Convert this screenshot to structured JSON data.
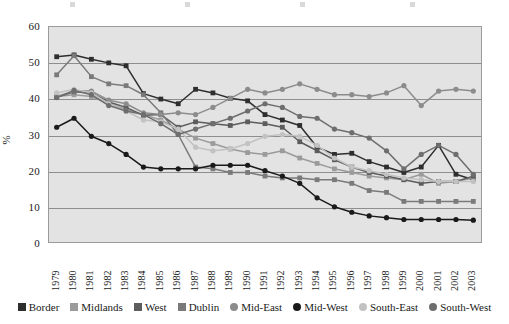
{
  "chart_data": {
    "type": "line",
    "title": "",
    "subtitle": "",
    "xlabel": "",
    "ylabel": "%",
    "ylim": [
      0,
      60
    ],
    "yticks": [
      0,
      10,
      20,
      30,
      40,
      50,
      60
    ],
    "grid": true,
    "legend_position": "bottom",
    "categories": [
      "1979",
      "1980",
      "1981",
      "1982",
      "1983",
      "1984",
      "1985",
      "1986",
      "1987",
      "1988",
      "1989",
      "1990",
      "1991",
      "1992",
      "1993",
      "1994",
      "1995",
      "1996",
      "1997",
      "1998",
      "1999",
      "2000",
      "2001",
      "2002",
      "2003"
    ],
    "series": [
      {
        "name": "Border",
        "marker": "square",
        "color": "#2e2e2e",
        "values": [
          51.5,
          52.0,
          50.8,
          49.8,
          49.0,
          41.3,
          39.8,
          38.5,
          42.5,
          41.5,
          40.0,
          39.3,
          35.5,
          34.0,
          32.5,
          26.5,
          24.5,
          24.8,
          22.5,
          21.0,
          19.5,
          21.0,
          27.0,
          19.0,
          17.5
        ]
      },
      {
        "name": "Midlands",
        "marker": "square",
        "color": "#9b9b9b",
        "values": [
          40.5,
          41.0,
          40.5,
          38.5,
          37.0,
          35.5,
          34.0,
          31.5,
          29.0,
          27.5,
          26.0,
          25.0,
          24.5,
          25.5,
          23.5,
          22.0,
          20.5,
          19.5,
          18.5,
          18.0,
          17.5,
          19.0,
          16.5,
          17.0,
          18.0
        ]
      },
      {
        "name": "West",
        "marker": "square",
        "color": "#5c5c5c",
        "values": [
          40.3,
          41.8,
          41.5,
          39.0,
          37.5,
          35.3,
          35.5,
          32.0,
          33.5,
          33.0,
          32.5,
          33.5,
          33.0,
          32.0,
          28.0,
          25.5,
          23.0,
          21.0,
          19.5,
          18.5,
          17.5,
          16.5,
          17.0,
          17.0,
          18.5
        ]
      },
      {
        "name": "Dublin",
        "marker": "square",
        "color": "#7a7a7a",
        "values": [
          46.5,
          51.8,
          46.0,
          44.0,
          43.5,
          41.0,
          36.0,
          30.0,
          21.0,
          20.5,
          19.5,
          19.5,
          18.5,
          18.0,
          18.0,
          17.5,
          17.5,
          16.5,
          14.5,
          14.0,
          11.5,
          11.5,
          11.5,
          11.5,
          11.5
        ]
      },
      {
        "name": "Mid-East",
        "marker": "circle",
        "color": "#8c8c8c",
        "values": [
          40.5,
          42.0,
          42.0,
          39.5,
          38.5,
          36.0,
          35.5,
          36.0,
          35.5,
          37.5,
          40.0,
          42.5,
          41.5,
          42.5,
          44.0,
          42.5,
          41.0,
          41.0,
          40.5,
          41.5,
          43.5,
          38.0,
          42.0,
          42.5,
          42.0
        ]
      },
      {
        "name": "Mid-West",
        "marker": "circle",
        "color": "#1a1a1a",
        "values": [
          32.0,
          34.5,
          29.5,
          27.5,
          24.5,
          21.0,
          20.5,
          20.5,
          20.5,
          21.5,
          21.5,
          21.5,
          20.0,
          18.5,
          16.5,
          12.5,
          10.0,
          8.5,
          7.5,
          7.0,
          6.5,
          6.5,
          6.5,
          6.5,
          6.3
        ]
      },
      {
        "name": "South-East",
        "marker": "circle",
        "color": "#c2c2c2",
        "values": [
          41.5,
          42.5,
          41.5,
          38.5,
          36.5,
          34.0,
          33.5,
          31.5,
          26.5,
          25.5,
          26.0,
          27.5,
          29.5,
          30.0,
          29.5,
          27.0,
          23.5,
          21.0,
          20.0,
          19.0,
          18.0,
          17.5,
          17.0,
          17.0,
          17.0
        ]
      },
      {
        "name": "South-West",
        "marker": "circle",
        "color": "#6e6e6e",
        "values": [
          40.2,
          42.2,
          41.0,
          38.0,
          36.5,
          35.5,
          33.0,
          30.0,
          31.5,
          33.0,
          34.5,
          36.5,
          38.5,
          37.5,
          35.0,
          34.5,
          31.5,
          30.5,
          29.0,
          25.5,
          20.5,
          24.5,
          27.0,
          24.5,
          19.0
        ]
      }
    ]
  },
  "axis": {
    "y_title": "%",
    "y_ticks": [
      "0",
      "10",
      "20",
      "30",
      "40",
      "50",
      "60"
    ],
    "x_ticks": [
      "1979",
      "1980",
      "1981",
      "1982",
      "1983",
      "1984",
      "1985",
      "1986",
      "1987",
      "1988",
      "1989",
      "1990",
      "1991",
      "1992",
      "1993",
      "1994",
      "1995",
      "1996",
      "1997",
      "1998",
      "1999",
      "2000",
      "2001",
      "2002",
      "2003"
    ]
  },
  "legend": {
    "items": [
      {
        "label": "Border",
        "marker": "square",
        "color": "#2e2e2e"
      },
      {
        "label": "Midlands",
        "marker": "square",
        "color": "#9b9b9b"
      },
      {
        "label": "West",
        "marker": "square",
        "color": "#5c5c5c"
      },
      {
        "label": "Dublin",
        "marker": "square",
        "color": "#7a7a7a"
      },
      {
        "label": "Mid-East",
        "marker": "circle",
        "color": "#8c8c8c"
      },
      {
        "label": "Mid-West",
        "marker": "circle",
        "color": "#1a1a1a"
      },
      {
        "label": "South-East",
        "marker": "circle",
        "color": "#c2c2c2"
      },
      {
        "label": "South-West",
        "marker": "circle",
        "color": "#6e6e6e"
      }
    ]
  },
  "style": {
    "plot_background": "#e3e3e3",
    "grid_color": "#8e8e8e",
    "frame_color": "#9a9a9a",
    "page_background": "#ffffff"
  }
}
